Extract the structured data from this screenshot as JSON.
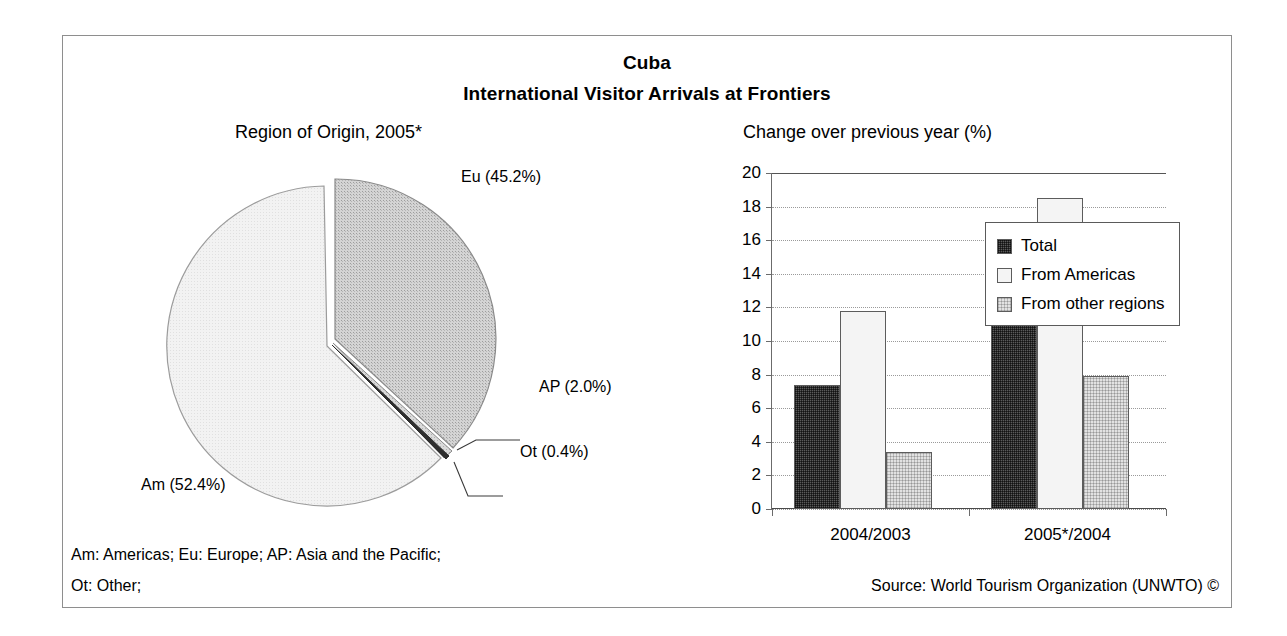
{
  "figure": {
    "title_line1": "Cuba",
    "title_line2": "International Visitor Arrivals at Frontiers",
    "pie_subtitle": "Region of Origin, 2005*",
    "bar_subtitle": "Change over previous year (%)",
    "footnote_line1": "Am: Americas; Eu: Europe; AP: Asia and the Pacific;",
    "footnote_line2": "Ot: Other;",
    "source": "Source: World Tourism Organization (UNWTO) ©"
  },
  "colors": {
    "frame": "#8e8e8e",
    "total": "#5a5a5a",
    "from_americas": "#f4f4f4",
    "from_other_regions": "#d8d8d8",
    "pie_eu": "#c9c9c9",
    "pie_am": "#f0f0f0",
    "pie_ap": "#d0d0d0",
    "pie_ot": "#2b2b2b",
    "gridline": "#9a9a9a",
    "axis": "#4a4a4a"
  },
  "pie_labels": {
    "eu": "Eu (45.2%)",
    "am": "Am (52.4%)",
    "ap": "AP (2.0%)",
    "ot": "Ot (0.4%)"
  },
  "yaxis_ticks": [
    "20",
    "18",
    "16",
    "14",
    "12",
    "10",
    "8",
    "6",
    "4",
    "2",
    "0"
  ],
  "chart_data": [
    {
      "type": "pie",
      "title": "Region of Origin, 2005*",
      "labels": [
        "Eu",
        "Am",
        "AP",
        "Ot"
      ],
      "label_texts": [
        "Eu (45.2%)",
        "Am (52.4%)",
        "AP (2.0%)",
        "Ot (0.4%)"
      ],
      "values": [
        45.2,
        52.4,
        2.0,
        0.4
      ],
      "unit": "%",
      "exploded": true,
      "legend": "none",
      "annotations": [
        "Am: Americas; Eu: Europe; AP: Asia and the Pacific;",
        "Ot: Other;"
      ]
    },
    {
      "type": "bar",
      "title": "Change over previous year (%)",
      "categories": [
        "2004/2003",
        "2005*/2004"
      ],
      "series": [
        {
          "name": "Total",
          "values": [
            7.4,
            13.1
          ]
        },
        {
          "name": "From Americas",
          "values": [
            11.8,
            18.5
          ]
        },
        {
          "name": "From other regions",
          "values": [
            3.4,
            7.9
          ]
        }
      ],
      "xlabel": "",
      "ylabel": "",
      "ylim": [
        0,
        20
      ],
      "ytick_step": 2,
      "grid": true,
      "legend_position": "top-right"
    }
  ]
}
